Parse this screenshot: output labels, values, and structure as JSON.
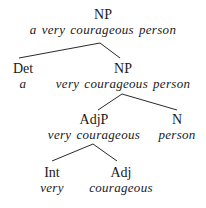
{
  "diagram": {
    "type": "syntax-tree",
    "colors": {
      "background": "#ffffff",
      "text": "#1a1a1a",
      "edge": "#2a2a2a"
    },
    "nodes": {
      "root": {
        "label": "NP",
        "words": "a very courageous person"
      },
      "det": {
        "label": "Det",
        "words": "a"
      },
      "np": {
        "label": "NP",
        "words": "very courageous person"
      },
      "adjp": {
        "label": "AdjP",
        "words": "very courageous"
      },
      "n": {
        "label": "N",
        "words": "person"
      },
      "int": {
        "label": "Int",
        "words": "very"
      },
      "adj": {
        "label": "Adj",
        "words": "courageous"
      }
    },
    "edges": [
      {
        "from": "root",
        "to": "det"
      },
      {
        "from": "root",
        "to": "np"
      },
      {
        "from": "np",
        "to": "adjp"
      },
      {
        "from": "np",
        "to": "n"
      },
      {
        "from": "adjp",
        "to": "int"
      },
      {
        "from": "adjp",
        "to": "adj"
      }
    ]
  }
}
